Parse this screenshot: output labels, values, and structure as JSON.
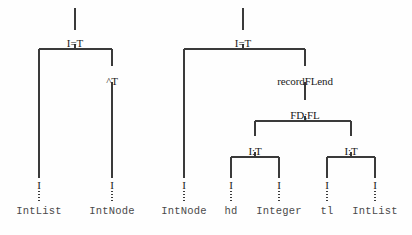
{
  "figure": {
    "background_color": "#fefefe",
    "line_color": "#3a3a3a",
    "text_color": "#1a1a1a",
    "leaf_text_color": "#4a4a4a",
    "width": 412,
    "height": 235
  },
  "trees": [
    {
      "id": "left-tree",
      "root_stub": {
        "x": 75,
        "y_top": 8,
        "y_bottom": 30
      },
      "nodes": [
        {
          "name": "left-root",
          "label": "I=T",
          "x": 75,
          "y": 38
        },
        {
          "name": "left-caret-t",
          "label": "^T",
          "x": 112,
          "y": 76
        }
      ],
      "edges": [
        {
          "name": "left-root-bar",
          "type": "hbar",
          "x1": 39,
          "x2": 112,
          "y": 49
        },
        {
          "name": "left-root-stem",
          "type": "vline",
          "x": 75,
          "y1": 44,
          "y2": 49
        },
        {
          "name": "left-branch-left",
          "type": "vline",
          "x": 39,
          "y1": 49,
          "y2": 178
        },
        {
          "name": "left-branch-right-upper",
          "type": "vline",
          "x": 112,
          "y1": 49,
          "y2": 66
        },
        {
          "name": "left-branch-right-lower",
          "type": "vline",
          "x": 112,
          "y1": 82,
          "y2": 178
        }
      ],
      "leaves": [
        {
          "name": "leaf-intlist-1",
          "mark": "I",
          "label": "IntList",
          "x": 39
        },
        {
          "name": "leaf-intnode-1",
          "mark": "I",
          "label": "IntNode",
          "x": 112
        }
      ]
    },
    {
      "id": "right-tree",
      "root_stub": {
        "x": 243,
        "y_top": 8,
        "y_bottom": 30
      },
      "nodes": [
        {
          "name": "right-root",
          "label": "I=T",
          "x": 243,
          "y": 38
        },
        {
          "name": "right-recordflend",
          "label": "recordFLend",
          "x": 305,
          "y": 76
        },
        {
          "name": "right-fdfl",
          "label": "FD;FL",
          "x": 305,
          "y": 110
        },
        {
          "name": "right-it-left",
          "label": "I:T",
          "x": 255,
          "y": 146
        },
        {
          "name": "right-it-right",
          "label": "I:T",
          "x": 351,
          "y": 146
        }
      ],
      "edges": [
        {
          "name": "right-root-bar",
          "type": "hbar",
          "x1": 184,
          "x2": 305,
          "y": 49
        },
        {
          "name": "right-root-stem",
          "type": "vline",
          "x": 243,
          "y1": 44,
          "y2": 49
        },
        {
          "name": "right-branch-far-left",
          "type": "vline",
          "x": 184,
          "y1": 49,
          "y2": 178
        },
        {
          "name": "right-branch-to-record",
          "type": "vline",
          "x": 305,
          "y1": 49,
          "y2": 66
        },
        {
          "name": "right-record-to-fdfl",
          "type": "vline",
          "x": 305,
          "y1": 82,
          "y2": 100
        },
        {
          "name": "right-fdfl-stem",
          "type": "vline",
          "x": 305,
          "y1": 116,
          "y2": 121
        },
        {
          "name": "right-fdfl-bar",
          "type": "hbar",
          "x1": 255,
          "x2": 351,
          "y": 121
        },
        {
          "name": "right-fdfl-left-drop",
          "type": "vline",
          "x": 255,
          "y1": 121,
          "y2": 136
        },
        {
          "name": "right-fdfl-right-drop",
          "type": "vline",
          "x": 351,
          "y1": 121,
          "y2": 136
        },
        {
          "name": "right-itl-stem",
          "type": "vline",
          "x": 255,
          "y1": 152,
          "y2": 157
        },
        {
          "name": "right-itl-bar",
          "type": "hbar",
          "x1": 231,
          "x2": 279,
          "y": 157
        },
        {
          "name": "right-itl-left-drop",
          "type": "vline",
          "x": 231,
          "y1": 157,
          "y2": 178
        },
        {
          "name": "right-itl-right-drop",
          "type": "vline",
          "x": 279,
          "y1": 157,
          "y2": 178
        },
        {
          "name": "right-itr-stem",
          "type": "vline",
          "x": 351,
          "y1": 152,
          "y2": 157
        },
        {
          "name": "right-itr-bar",
          "type": "hbar",
          "x1": 327,
          "x2": 375,
          "y": 157
        },
        {
          "name": "right-itr-left-drop",
          "type": "vline",
          "x": 327,
          "y1": 157,
          "y2": 178
        },
        {
          "name": "right-itr-right-drop",
          "type": "vline",
          "x": 375,
          "y1": 157,
          "y2": 178
        }
      ],
      "leaves": [
        {
          "name": "leaf-intnode-2",
          "mark": "I",
          "label": "IntNode",
          "x": 184
        },
        {
          "name": "leaf-hd",
          "mark": "I",
          "label": "hd",
          "x": 231
        },
        {
          "name": "leaf-integer",
          "mark": "I",
          "label": "Integer",
          "x": 279
        },
        {
          "name": "leaf-tl",
          "mark": "I",
          "label": "tl",
          "x": 327
        },
        {
          "name": "leaf-intlist-2",
          "mark": "I",
          "label": "IntList",
          "x": 375
        }
      ]
    }
  ],
  "leaf_geometry": {
    "mark_y": 180,
    "dotted_y1": 191,
    "dotted_y2": 203,
    "label_y": 206
  }
}
